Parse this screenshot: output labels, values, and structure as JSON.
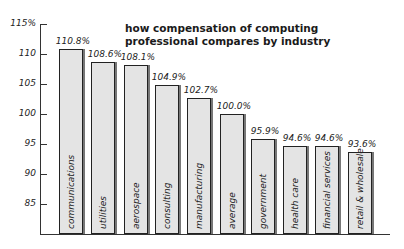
{
  "chart_data": {
    "type": "bar",
    "title": "how compensation of computing professional compares by industry",
    "title_lines": [
      "how compensation of computing",
      "professional compares by industry"
    ],
    "xlabel": "",
    "ylabel": "",
    "ylim": [
      80,
      115
    ],
    "grid": false,
    "legend": null,
    "y_ticks": [
      "115%",
      "110",
      "105",
      "100",
      "95",
      "90",
      "85"
    ],
    "y_tick_values": [
      115,
      110,
      105,
      100,
      95,
      90,
      85
    ],
    "categories": [
      "communications",
      "utilities",
      "aerospace",
      "consulting",
      "manufacturing",
      "average",
      "government",
      "health care",
      "financial services",
      "retail & wholesale"
    ],
    "values": [
      110.8,
      108.6,
      108.1,
      104.9,
      102.7,
      100.0,
      95.9,
      94.6,
      94.6,
      93.6
    ],
    "value_labels": [
      "110.8%",
      "108.6%",
      "108.1%",
      "104.9%",
      "102.7%",
      "100.0%",
      "95.9%",
      "94.6%",
      "94.6%",
      "93.6%"
    ],
    "bar_color": "#e4e4e4",
    "bar_edge_color": "#222222"
  }
}
